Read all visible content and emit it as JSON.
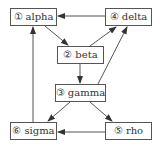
{
  "diagram": {
    "type": "directed-graph",
    "colors": {
      "stroke": "#555555",
      "text": "#333333",
      "background": "#ffffff"
    },
    "nodes": [
      {
        "id": "alpha",
        "num": "①",
        "label": "alpha",
        "x": 10,
        "y": 8,
        "w": 47,
        "h": 18
      },
      {
        "id": "beta",
        "num": "②",
        "label": "beta",
        "x": 57,
        "y": 46,
        "w": 47,
        "h": 18
      },
      {
        "id": "gamma",
        "num": "③",
        "label": "gamma",
        "x": 55,
        "y": 84,
        "w": 51,
        "h": 18
      },
      {
        "id": "delta",
        "num": "④",
        "label": "delta",
        "x": 105,
        "y": 8,
        "w": 47,
        "h": 18
      },
      {
        "id": "rho",
        "num": "⑤",
        "label": "rho",
        "x": 105,
        "y": 122,
        "w": 47,
        "h": 18
      },
      {
        "id": "sigma",
        "num": "⑥",
        "label": "sigma",
        "x": 10,
        "y": 122,
        "w": 47,
        "h": 18
      }
    ],
    "edges": [
      {
        "from": "delta",
        "to": "alpha",
        "x1": 105,
        "y1": 16,
        "x2": 58,
        "y2": 16
      },
      {
        "from": "alpha",
        "to": "beta",
        "x1": 45,
        "y1": 26,
        "x2": 68,
        "y2": 45
      },
      {
        "from": "beta",
        "to": "delta",
        "x1": 90,
        "y1": 46,
        "x2": 116,
        "y2": 27
      },
      {
        "from": "beta",
        "to": "gamma",
        "x1": 80,
        "y1": 64,
        "x2": 80,
        "y2": 83
      },
      {
        "from": "gamma",
        "to": "delta",
        "x1": 98,
        "y1": 84,
        "x2": 127,
        "y2": 27
      },
      {
        "from": "gamma",
        "to": "sigma",
        "x1": 70,
        "y1": 102,
        "x2": 48,
        "y2": 121
      },
      {
        "from": "gamma",
        "to": "rho",
        "x1": 90,
        "y1": 102,
        "x2": 112,
        "y2": 121
      },
      {
        "from": "rho",
        "to": "sigma",
        "x1": 105,
        "y1": 132,
        "x2": 58,
        "y2": 132
      },
      {
        "from": "sigma",
        "to": "alpha",
        "x1": 33,
        "y1": 122,
        "x2": 33,
        "y2": 27
      }
    ]
  }
}
